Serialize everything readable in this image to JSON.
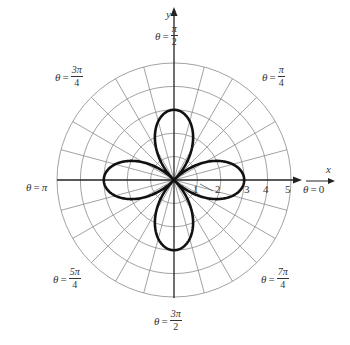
{
  "chart_data": {
    "type": "polar",
    "title": "",
    "curve": {
      "equation": "r = 3 cos 2θ",
      "amplitude": 3,
      "petals": 4,
      "petal_directions": [
        "θ = 0",
        "θ = π/2",
        "θ = π",
        "θ = 3π/2"
      ],
      "stroke_color": "#111111"
    },
    "grid": {
      "rings": [
        1,
        2,
        3,
        4,
        5
      ],
      "radial_step_degrees": 15,
      "color": "#8a8a8a"
    },
    "radial_tick_labels": [
      "1",
      "2",
      "3",
      "4",
      "5"
    ],
    "axis_labels": {
      "x": "x",
      "y": "y"
    },
    "angle_labels": [
      {
        "id": "0",
        "prefix": "θ = ",
        "value": "0"
      },
      {
        "id": "pi_4",
        "prefix": "θ = ",
        "num": "π",
        "den": "4"
      },
      {
        "id": "pi_2",
        "prefix": "θ = ",
        "num": "π",
        "den": "2"
      },
      {
        "id": "3pi_4",
        "prefix": "θ = ",
        "num": "3π",
        "den": "4"
      },
      {
        "id": "pi",
        "prefix": "θ = ",
        "value": "π"
      },
      {
        "id": "5pi_4",
        "prefix": "θ = ",
        "num": "5π",
        "den": "4"
      },
      {
        "id": "3pi_2",
        "prefix": "θ = ",
        "num": "3π",
        "den": "2"
      },
      {
        "id": "7pi_4",
        "prefix": "θ = ",
        "num": "7π",
        "den": "4"
      }
    ]
  },
  "labels": {
    "x_axis": "x",
    "y_axis": "y",
    "theta": "θ",
    "equals": "=",
    "zero": "0",
    "pi": "π",
    "ticks": [
      "1",
      "2",
      "3",
      "4",
      "5"
    ],
    "frac_pi_4": {
      "num": "π",
      "den": "4"
    },
    "frac_pi_2": {
      "num": "π",
      "den": "2"
    },
    "frac_3pi_4": {
      "num": "3π",
      "den": "4"
    },
    "frac_5pi_4": {
      "num": "5π",
      "den": "4"
    },
    "frac_3pi_2": {
      "num": "3π",
      "den": "2"
    },
    "frac_7pi_4": {
      "num": "7π",
      "den": "4"
    }
  }
}
